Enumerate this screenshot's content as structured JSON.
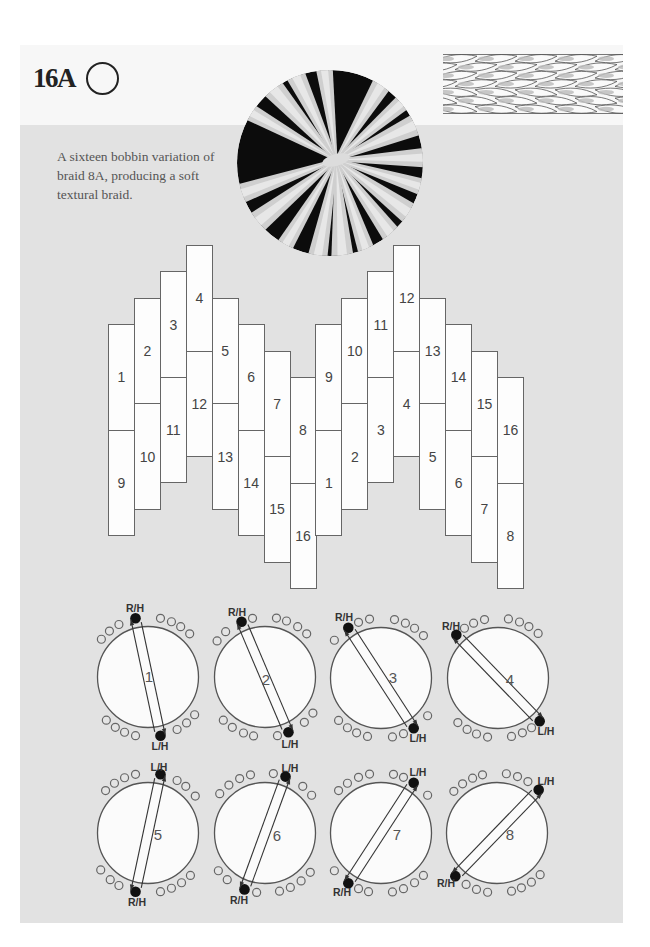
{
  "page": {
    "title": "16A",
    "title_icon": "open-circle-icon",
    "description_lines": [
      "A sixteen bobbin variation of",
      "braid 8A, producing a soft",
      "textural braid."
    ]
  },
  "colors": {
    "panel_bg": "#e2e2e2",
    "ink": "#222222",
    "text": "#555555",
    "active_bobbin": "#111111",
    "bobbin_slot_fill": "#e4e4e4"
  },
  "plait_grid": {
    "columns": [
      {
        "top_label": "1",
        "bottom_label": "9",
        "step": 3
      },
      {
        "top_label": "2",
        "bottom_label": "10",
        "step": 2
      },
      {
        "top_label": "3",
        "bottom_label": "11",
        "step": 1
      },
      {
        "top_label": "4",
        "bottom_label": "12",
        "step": 0
      },
      {
        "top_label": "5",
        "bottom_label": "13",
        "step": 2
      },
      {
        "top_label": "6",
        "bottom_label": "14",
        "step": 3
      },
      {
        "top_label": "7",
        "bottom_label": "15",
        "step": 4
      },
      {
        "top_label": "8",
        "bottom_label": "16",
        "step": 5
      },
      {
        "top_label": "9",
        "bottom_label": "1",
        "step": 3
      },
      {
        "top_label": "10",
        "bottom_label": "2",
        "step": 2
      },
      {
        "top_label": "11",
        "bottom_label": "3",
        "step": 1
      },
      {
        "top_label": "12",
        "bottom_label": "4",
        "step": 0
      },
      {
        "top_label": "13",
        "bottom_label": "5",
        "step": 2
      },
      {
        "top_label": "14",
        "bottom_label": "6",
        "step": 3
      },
      {
        "top_label": "15",
        "bottom_label": "7",
        "step": 4
      },
      {
        "top_label": "16",
        "bottom_label": "8",
        "step": 5
      }
    ]
  },
  "moves": [
    {
      "number": "1",
      "top_label": "R/H",
      "bottom_label": "L/H",
      "center": [
        148,
        677
      ],
      "top_slots": [
        -51,
        -40,
        -29,
        -12,
        12,
        23,
        33,
        44
      ],
      "active_slot": 3,
      "arrow_mode": "left_up",
      "top_label_pos": [
        135,
        612
      ],
      "bottom_label_pos": [
        160,
        750
      ],
      "number_pos": [
        149,
        682
      ]
    },
    {
      "number": "2",
      "top_label": "R/H",
      "bottom_label": "L/H",
      "center": [
        265,
        677
      ],
      "top_slots": [
        -53,
        -41,
        -23,
        -12,
        11,
        21,
        33,
        44
      ],
      "active_slot": 2,
      "arrow_mode": "left_up",
      "top_label_pos": [
        237,
        616
      ],
      "bottom_label_pos": [
        290,
        748
      ],
      "number_pos": [
        266,
        685
      ]
    },
    {
      "number": "3",
      "top_label": "R/H",
      "bottom_label": "L/H",
      "center": [
        381,
        678
      ],
      "top_slots": [
        -51,
        -33,
        -22,
        -11,
        13,
        24,
        34,
        45
      ],
      "active_slot": 1,
      "arrow_mode": "left_up",
      "top_label_pos": [
        344,
        621
      ],
      "bottom_label_pos": [
        418,
        742
      ],
      "number_pos": [
        393,
        683
      ]
    },
    {
      "number": "4",
      "top_label": "R/H",
      "bottom_label": "L/H",
      "center": [
        498,
        678
      ],
      "top_slots": [
        -44,
        -34,
        -24,
        -13,
        10,
        21,
        31,
        42
      ],
      "active_slot": 0,
      "arrow_mode": "left_up",
      "top_label_pos": [
        451,
        630
      ],
      "bottom_label_pos": [
        546,
        735
      ],
      "number_pos": [
        510,
        685
      ]
    },
    {
      "number": "5",
      "top_label": "L/H",
      "bottom_label": "R/H",
      "center": [
        148,
        833
      ],
      "top_slots": [
        -45,
        -34,
        -23,
        -12,
        12,
        29,
        39,
        52
      ],
      "active_slot": 4,
      "arrow_mode": "left_down",
      "top_label_pos": [
        159,
        771
      ],
      "bottom_label_pos": [
        137,
        906
      ],
      "number_pos": [
        158,
        840
      ]
    },
    {
      "number": "6",
      "top_label": "L/H",
      "bottom_label": "R/H",
      "center": [
        265,
        833
      ],
      "top_slots": [
        -49,
        -37,
        -25,
        -14,
        8,
        20,
        39,
        51
      ],
      "active_slot": 5,
      "arrow_mode": "left_down",
      "top_label_pos": [
        290,
        772
      ],
      "bottom_label_pos": [
        239,
        904
      ],
      "number_pos": [
        277,
        841
      ]
    },
    {
      "number": "7",
      "top_label": "L/H",
      "bottom_label": "R/H",
      "center": [
        381,
        833
      ],
      "top_slots": [
        -45,
        -34,
        -22,
        -11,
        12,
        22,
        33,
        51
      ],
      "active_slot": 6,
      "arrow_mode": "left_down",
      "top_label_pos": [
        418,
        776
      ],
      "bottom_label_pos": [
        342,
        896
      ],
      "number_pos": [
        397,
        840
      ]
    },
    {
      "number": "8",
      "top_label": "L/H",
      "bottom_label": "R/H",
      "center": [
        497,
        833
      ],
      "top_slots": [
        -46,
        -35,
        -24,
        -14,
        9,
        20,
        31,
        44
      ],
      "active_slot": 7,
      "arrow_mode": "left_down",
      "top_label_pos": [
        546,
        785
      ],
      "bottom_label_pos": [
        446,
        887
      ],
      "number_pos": [
        510,
        840
      ]
    }
  ]
}
